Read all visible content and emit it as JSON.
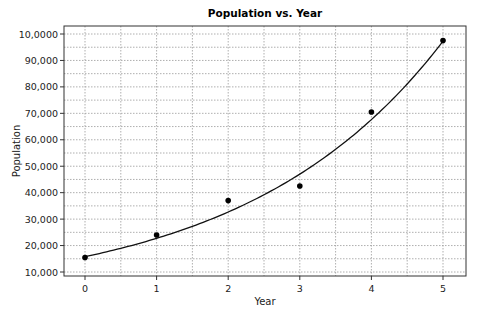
{
  "chart_data": {
    "type": "scatter",
    "title": "Population vs. Year",
    "xlabel": "Year",
    "ylabel": "Population",
    "x_ticks": [
      0,
      1,
      2,
      3,
      4,
      5
    ],
    "y_ticks": [
      10000,
      20000,
      30000,
      40000,
      50000,
      60000,
      70000,
      80000,
      90000,
      100000
    ],
    "y_tick_labels": [
      "10,000",
      "20,000",
      "30,000",
      "40,000",
      "50,000",
      "60,000",
      "70,000",
      "80,000",
      "90,000",
      "10,0000"
    ],
    "xlim": [
      -0.3,
      5.3
    ],
    "ylim": [
      9000,
      102000
    ],
    "grid": "dotted, major and minor",
    "legend": "none",
    "series": [
      {
        "name": "Observed population",
        "kind": "points",
        "x": [
          0,
          1,
          2,
          3,
          4,
          5
        ],
        "y": [
          15500,
          24000,
          37000,
          42500,
          70500,
          97500
        ]
      },
      {
        "name": "Exponential fit",
        "kind": "line",
        "model": "y = a*e^(b*x)",
        "a": 15800,
        "b": 0.3635
      }
    ]
  },
  "colors": {
    "background": "#ffffff",
    "axis": "#333333",
    "grid": "#9a9a9a",
    "data": "#000000"
  }
}
